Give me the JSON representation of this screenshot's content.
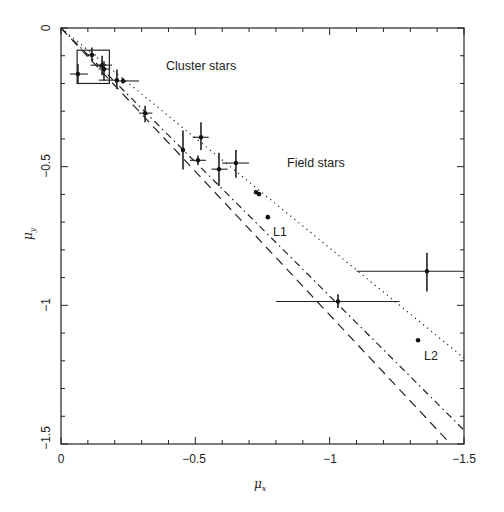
{
  "chart_data": {
    "type": "scatter",
    "title": "",
    "xlabel": "μ_x",
    "ylabel": "μ_y",
    "xlim": [
      0,
      -1.5
    ],
    "ylim": [
      -1.5,
      0
    ],
    "x_ticks": [
      0,
      -0.5,
      -1,
      -1.5
    ],
    "x_tick_labels": [
      "0",
      "−0.5",
      "−1",
      "−1.5"
    ],
    "y_ticks": [
      0,
      -0.5,
      -1,
      -1.5
    ],
    "y_tick_labels": [
      "0",
      "−0.5",
      "−1",
      "−1.5"
    ],
    "minor_tick_step": 0.1,
    "grid": false,
    "legend": null,
    "annotations": [
      {
        "text": "Cluster stars",
        "x": -0.48,
        "y": -0.14
      },
      {
        "text": "Field stars",
        "x": -0.9,
        "y": -0.5
      },
      {
        "text": "L1",
        "x": -0.79,
        "y": -0.72
      },
      {
        "text": "L2",
        "x": -1.36,
        "y": -1.18
      }
    ],
    "cluster_box": {
      "x0": -0.06,
      "x1": -0.18,
      "y0": -0.08,
      "y1": -0.2
    },
    "points_with_errors": [
      {
        "x": -0.063,
        "y": -0.166,
        "xerr": [
          -0.033,
          -0.1
        ],
        "yerr": [
          -0.13,
          -0.2
        ]
      },
      {
        "x": -0.115,
        "y": -0.097,
        "xerr": [
          -0.1,
          -0.13
        ],
        "yerr": [
          -0.07,
          -0.12
        ]
      },
      {
        "x": -0.153,
        "y": -0.134,
        "xerr": [
          -0.11,
          -0.19
        ],
        "yerr": [
          -0.1,
          -0.17
        ]
      },
      {
        "x": -0.16,
        "y": -0.148,
        "xerr": [
          -0.14,
          -0.18
        ],
        "yerr": [
          -0.12,
          -0.19
        ]
      },
      {
        "x": -0.208,
        "y": -0.188,
        "xerr": [
          -0.14,
          -0.21
        ],
        "yerr": [
          -0.15,
          -0.22
        ]
      },
      {
        "x": -0.231,
        "y": -0.191,
        "xerr": [
          -0.21,
          -0.29
        ],
        "yerr": [
          -0.18,
          -0.2
        ]
      },
      {
        "x": -0.313,
        "y": -0.307,
        "xerr": [
          -0.29,
          -0.34
        ],
        "yerr": [
          -0.28,
          -0.34
        ]
      },
      {
        "x": -0.454,
        "y": -0.44,
        "xerr": [
          -0.45,
          -0.46
        ],
        "yerr": [
          -0.37,
          -0.51
        ]
      },
      {
        "x": -0.521,
        "y": -0.394,
        "xerr": [
          -0.49,
          -0.55
        ],
        "yerr": [
          -0.34,
          -0.44
        ]
      },
      {
        "x": -0.51,
        "y": -0.477,
        "xerr": [
          -0.48,
          -0.54
        ],
        "yerr": [
          -0.46,
          -0.49
        ]
      },
      {
        "x": -0.588,
        "y": -0.509,
        "xerr": [
          -0.56,
          -0.62
        ],
        "yerr": [
          -0.45,
          -0.57
        ]
      },
      {
        "x": -0.651,
        "y": -0.487,
        "xerr": [
          -0.6,
          -0.7
        ],
        "yerr": [
          -0.44,
          -0.54
        ]
      },
      {
        "x": -1.031,
        "y": -0.986,
        "xerr": [
          -0.8,
          -1.26
        ],
        "yerr": [
          -0.96,
          -1.01
        ]
      },
      {
        "x": -1.362,
        "y": -0.877,
        "xerr": [
          -1.1,
          -1.5
        ],
        "yerr": [
          -0.81,
          -0.95
        ]
      }
    ],
    "points": [
      {
        "x": -0.726,
        "y": -0.592
      },
      {
        "x": -0.737,
        "y": -0.599
      },
      {
        "x": -0.77,
        "y": -0.682,
        "label": "L1"
      },
      {
        "x": -1.329,
        "y": -1.126,
        "label": "L2"
      }
    ],
    "lines": [
      {
        "style": "dotted",
        "from": [
          0,
          0
        ],
        "to": [
          -1.5,
          -1.19
        ]
      },
      {
        "style": "dash-dot",
        "from": [
          0,
          0
        ],
        "to": [
          -1.5,
          -1.45
        ]
      },
      {
        "style": "dashed",
        "from": [
          0,
          0
        ],
        "to": [
          -1.45,
          -1.5
        ]
      }
    ]
  },
  "labels": {
    "x_axis": "μ",
    "x_axis_sub": "x",
    "y_axis": "μ",
    "y_axis_sub": "y",
    "cluster": "Cluster stars",
    "field": "Field stars",
    "l1": "L1",
    "l2": "L2",
    "xt0": "0",
    "xt1": "−0.5",
    "xt2": "−1",
    "xt3": "−1.5",
    "yt0": "0",
    "yt1": "−0.5",
    "yt2": "−1",
    "yt3": "−1.5"
  }
}
